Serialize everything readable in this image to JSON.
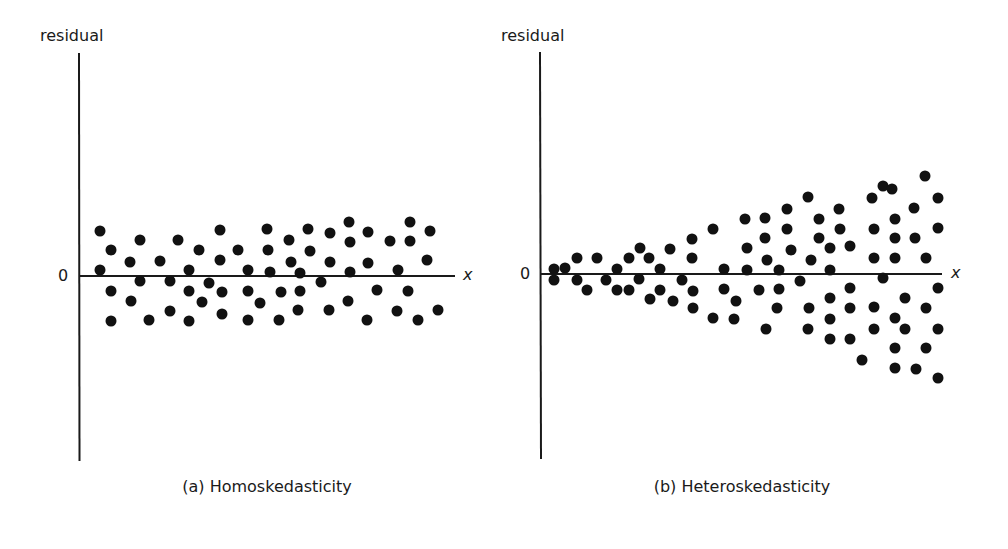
{
  "panels": [
    {
      "ylabel": "residual",
      "zero_label": "0",
      "xlabel": "x",
      "caption": "(a) Homoskedasticity"
    },
    {
      "ylabel": "residual",
      "zero_label": "0",
      "xlabel": "x",
      "caption": "(b) Heteroskedasticity"
    }
  ],
  "chart_data": [
    {
      "type": "scatter",
      "title": "(a) Homoskedasticity",
      "xlabel": "x",
      "ylabel": "residual",
      "yticks": [
        "0"
      ],
      "grid": false,
      "legend": null,
      "axes_px": {
        "origin": [
          79,
          276
        ],
        "x_end": 455,
        "y_top": 53,
        "y_bottom": 461
      },
      "points_px": [
        [
          100,
          231
        ],
        [
          100,
          270
        ],
        [
          111,
          250
        ],
        [
          111,
          291
        ],
        [
          111,
          321
        ],
        [
          130,
          262
        ],
        [
          131,
          301
        ],
        [
          140,
          240
        ],
        [
          140,
          281
        ],
        [
          149,
          320
        ],
        [
          160,
          261
        ],
        [
          170,
          281
        ],
        [
          170,
          311
        ],
        [
          178,
          240
        ],
        [
          189,
          270
        ],
        [
          189,
          291
        ],
        [
          189,
          321
        ],
        [
          199,
          250
        ],
        [
          202,
          302
        ],
        [
          209,
          283
        ],
        [
          220,
          230
        ],
        [
          220,
          260
        ],
        [
          222,
          292
        ],
        [
          222,
          314
        ],
        [
          238,
          250
        ],
        [
          248,
          270
        ],
        [
          248,
          291
        ],
        [
          248,
          320
        ],
        [
          260,
          303
        ],
        [
          267,
          229
        ],
        [
          268,
          250
        ],
        [
          270,
          272
        ],
        [
          281,
          292
        ],
        [
          279,
          320
        ],
        [
          289,
          240
        ],
        [
          291,
          262
        ],
        [
          300,
          273
        ],
        [
          300,
          291
        ],
        [
          298,
          310
        ],
        [
          308,
          229
        ],
        [
          310,
          251
        ],
        [
          321,
          282
        ],
        [
          330,
          233
        ],
        [
          330,
          262
        ],
        [
          329,
          310
        ],
        [
          349,
          222
        ],
        [
          350,
          242
        ],
        [
          350,
          272
        ],
        [
          348,
          301
        ],
        [
          368,
          232
        ],
        [
          368,
          263
        ],
        [
          377,
          290
        ],
        [
          367,
          320
        ],
        [
          390,
          241
        ],
        [
          398,
          270
        ],
        [
          397,
          311
        ],
        [
          410,
          222
        ],
        [
          410,
          241
        ],
        [
          408,
          291
        ],
        [
          418,
          320
        ],
        [
          427,
          260
        ],
        [
          430,
          231
        ],
        [
          438,
          310
        ]
      ]
    },
    {
      "type": "scatter",
      "title": "(b) Heteroskedasticity",
      "xlabel": "x",
      "ylabel": "residual",
      "yticks": [
        "0"
      ],
      "grid": false,
      "legend": null,
      "axes_px": {
        "origin": [
          540,
          274
        ],
        "x_end": 942,
        "y_top": 52,
        "y_bottom": 459
      },
      "points_px": [
        [
          554,
          269
        ],
        [
          554,
          280
        ],
        [
          565,
          268
        ],
        [
          577,
          258
        ],
        [
          577,
          280
        ],
        [
          587,
          290
        ],
        [
          597,
          258
        ],
        [
          606,
          280
        ],
        [
          617,
          269
        ],
        [
          617,
          290
        ],
        [
          629,
          290
        ],
        [
          629,
          258
        ],
        [
          640,
          248
        ],
        [
          639,
          279
        ],
        [
          649,
          258
        ],
        [
          650,
          299
        ],
        [
          660,
          269
        ],
        [
          660,
          290
        ],
        [
          670,
          249
        ],
        [
          673,
          301
        ],
        [
          682,
          280
        ],
        [
          692,
          239
        ],
        [
          692,
          258
        ],
        [
          693,
          291
        ],
        [
          693,
          308
        ],
        [
          713,
          318
        ],
        [
          713,
          229
        ],
        [
          724,
          269
        ],
        [
          724,
          289
        ],
        [
          736,
          301
        ],
        [
          734,
          319
        ],
        [
          745,
          219
        ],
        [
          747,
          248
        ],
        [
          747,
          270
        ],
        [
          759,
          290
        ],
        [
          765,
          218
        ],
        [
          765,
          238
        ],
        [
          767,
          260
        ],
        [
          766,
          329
        ],
        [
          779,
          270
        ],
        [
          779,
          289
        ],
        [
          777,
          308
        ],
        [
          787,
          209
        ],
        [
          787,
          229
        ],
        [
          791,
          250
        ],
        [
          800,
          281
        ],
        [
          808,
          329
        ],
        [
          809,
          308
        ],
        [
          811,
          260
        ],
        [
          808,
          197
        ],
        [
          819,
          219
        ],
        [
          819,
          238
        ],
        [
          830,
          248
        ],
        [
          830,
          270
        ],
        [
          830,
          298
        ],
        [
          830,
          319
        ],
        [
          830,
          339
        ],
        [
          839,
          209
        ],
        [
          840,
          229
        ],
        [
          850,
          246
        ],
        [
          850,
          288
        ],
        [
          850,
          308
        ],
        [
          850,
          339
        ],
        [
          862,
          360
        ],
        [
          872,
          198
        ],
        [
          874,
          229
        ],
        [
          874,
          258
        ],
        [
          874,
          307
        ],
        [
          874,
          329
        ],
        [
          883,
          186
        ],
        [
          883,
          278
        ],
        [
          892,
          189
        ],
        [
          895,
          219
        ],
        [
          895,
          238
        ],
        [
          895,
          258
        ],
        [
          895,
          318
        ],
        [
          895,
          348
        ],
        [
          895,
          368
        ],
        [
          905,
          298
        ],
        [
          905,
          329
        ],
        [
          914,
          208
        ],
        [
          915,
          238
        ],
        [
          916,
          369
        ],
        [
          925,
          176
        ],
        [
          926,
          258
        ],
        [
          926,
          308
        ],
        [
          926,
          348
        ],
        [
          938,
          198
        ],
        [
          938,
          228
        ],
        [
          938,
          288
        ],
        [
          938,
          329
        ],
        [
          938,
          378
        ]
      ]
    }
  ]
}
